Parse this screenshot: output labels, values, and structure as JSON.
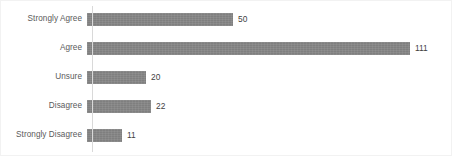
{
  "chart_data": {
    "type": "bar",
    "orientation": "horizontal",
    "title": "",
    "subtitle": "",
    "xlabel": "",
    "ylabel": "",
    "categories": [
      "Strongly Agree",
      "Agree",
      "Unsure",
      "Disagree",
      "Strongly Disagree"
    ],
    "values": [
      50,
      111,
      20,
      22,
      11
    ],
    "value_labels": [
      "50",
      "111",
      "20",
      "22",
      "11"
    ],
    "xlim": [
      0,
      111
    ],
    "grid": false,
    "legend": null,
    "bar_color": "#7f7f7f",
    "axis_color": "#d9d9d9",
    "category_label_color": "#5a5a5a",
    "value_label_color": "#3f3f3f",
    "background_color": "#ffffff",
    "border_color": "#f2f2f2"
  },
  "chart": {
    "rows": [
      {
        "label": "Strongly Agree",
        "value": 50,
        "value_label": "50",
        "bar_px": 146,
        "top_px": 4
      },
      {
        "label": "Agree",
        "value": 111,
        "value_label": "111",
        "bar_px": 323,
        "top_px": 33
      },
      {
        "label": "Unsure",
        "value": 20,
        "value_label": "20",
        "bar_px": 59,
        "top_px": 62
      },
      {
        "label": "Disagree",
        "value": 22,
        "value_label": "22",
        "bar_px": 64,
        "top_px": 91
      },
      {
        "label": "Strongly Disagree",
        "value": 11,
        "value_label": "11",
        "bar_px": 35,
        "top_px": 120
      }
    ]
  }
}
